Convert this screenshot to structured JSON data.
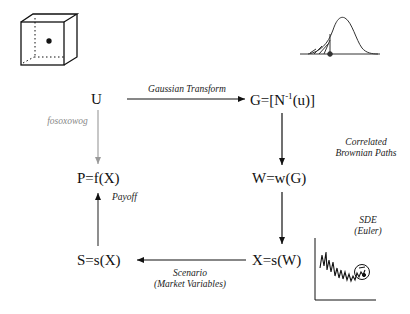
{
  "nodes": {
    "u": "U",
    "g": "G=[N",
    "g_sup": "-1",
    "g_tail": "(u)]",
    "w": "W=w(G)",
    "x": "X=s(W)",
    "s": "S=s(X)",
    "p": "P=f(X)"
  },
  "edges": {
    "u_to_g": "Gaussian Transform",
    "g_to_w_line1": "Correlated",
    "g_to_w_line2": "Brownian Paths",
    "w_to_x_line1": "SDE",
    "w_to_x_line2": "(Euler)",
    "x_to_s_line1": "Scenario",
    "x_to_s_line2": "(Market Variables)",
    "s_to_p": "Payoff",
    "u_to_p": "fosoxowog"
  },
  "icons": {
    "cube": "uniform-cube-icon",
    "bell": "normal-distribution-icon",
    "path": "price-path-chart-icon"
  },
  "colors": {
    "ink": "#111111",
    "gray_arrow": "#999999",
    "gray_label": "#888888"
  }
}
